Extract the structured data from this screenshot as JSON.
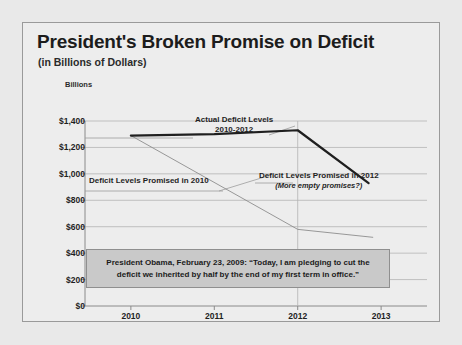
{
  "chart_data": {
    "type": "line",
    "title": "President's Broken Promise on Deficit",
    "subtitle": "(in Billions of Dollars)",
    "ylabel": "Billions",
    "xlabel": "",
    "categories": [
      "2010",
      "2011",
      "2012",
      "2013"
    ],
    "x": [
      2010,
      2011,
      2012,
      2013
    ],
    "ylim": [
      0,
      1400
    ],
    "yticks": [
      "$0",
      "$200",
      "$400",
      "$600",
      "$800",
      "$1,000",
      "$1,200",
      "$1,400"
    ],
    "ytick_values": [
      0,
      200,
      400,
      600,
      800,
      1000,
      1200,
      1400
    ],
    "grid": true,
    "legend_position": "none",
    "series": [
      {
        "name": "Actual Deficit Levels 2010-2012",
        "x": [
          2010,
          2011,
          2012,
          2012.85
        ],
        "values": [
          1290,
          1300,
          1330,
          930
        ],
        "style": "thick",
        "color": "#1f1f1f"
      },
      {
        "name": "Deficit Levels Promised in 2010",
        "x": [
          2010,
          2012,
          2012.9
        ],
        "values": [
          1290,
          580,
          520
        ],
        "style": "thin",
        "color": "#8d8d8d"
      }
    ],
    "annotations": [
      {
        "id": "actual",
        "line1": "Actual Deficit Levels",
        "line2": "2010-2012"
      },
      {
        "id": "promised_2010",
        "line1": "Deficit Levels Promised in 2010",
        "line2": ""
      },
      {
        "id": "promised_2012",
        "line1": "Deficit Levels Promised in 2012",
        "line2": "(More empty promises?)"
      }
    ],
    "quote": "President Obama, February 23, 2009: “Today, I am pledging to cut the deficit we inherited by half by the end of my first term in office.”"
  },
  "colors": {
    "page_background": "#e9e9e9",
    "panel_background": "#ededed",
    "panel_border": "#9a9a9a",
    "grid": "#b4b4b4",
    "axis": "#8a8a8a",
    "text": "#1f1f1f",
    "actual_line": "#1f1f1f",
    "promised_line": "#8d8d8d",
    "quote_background": "#c9c9c9",
    "quote_border": "#8f8f8f"
  }
}
